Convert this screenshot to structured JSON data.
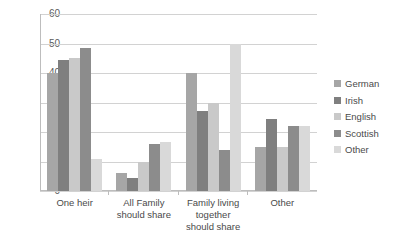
{
  "chart_data": {
    "type": "bar",
    "title": "",
    "subtitle": "",
    "xlabel": "",
    "ylabel": "",
    "ylim": [
      0,
      60
    ],
    "ytick_step": 10,
    "yticks": [
      60,
      50,
      40,
      30,
      20,
      10,
      0
    ],
    "grid": "horizontal",
    "legend_position": "right",
    "categories": [
      "One heir",
      "All Family should share",
      "Family living together should share",
      "Other"
    ],
    "series": [
      {
        "name": "German",
        "color": "#a6a6a6",
        "values": [
          40,
          6,
          40,
          15
        ]
      },
      {
        "name": "Irish",
        "color": "#7f7f7f",
        "values": [
          44.5,
          4.5,
          27,
          24.5
        ]
      },
      {
        "name": "English",
        "color": "#c9c9c9",
        "values": [
          45,
          10,
          30,
          15
        ]
      },
      {
        "name": "Scottish",
        "color": "#8c8c8c",
        "values": [
          48.5,
          16,
          14,
          22
        ]
      },
      {
        "name": "Other",
        "color": "#d9d9d9",
        "values": [
          11,
          16.5,
          50,
          22
        ]
      }
    ]
  },
  "legend": {
    "items": [
      {
        "label": "German"
      },
      {
        "label": "Irish"
      },
      {
        "label": "English"
      },
      {
        "label": "Scottish"
      },
      {
        "label": "Other"
      }
    ]
  },
  "colors": {
    "background": "#ffffff",
    "gridline": "#d2d2d2",
    "axis": "#bdbdbd",
    "tick_text": "#5a5a5a",
    "label_text": "#4a4a4a"
  }
}
